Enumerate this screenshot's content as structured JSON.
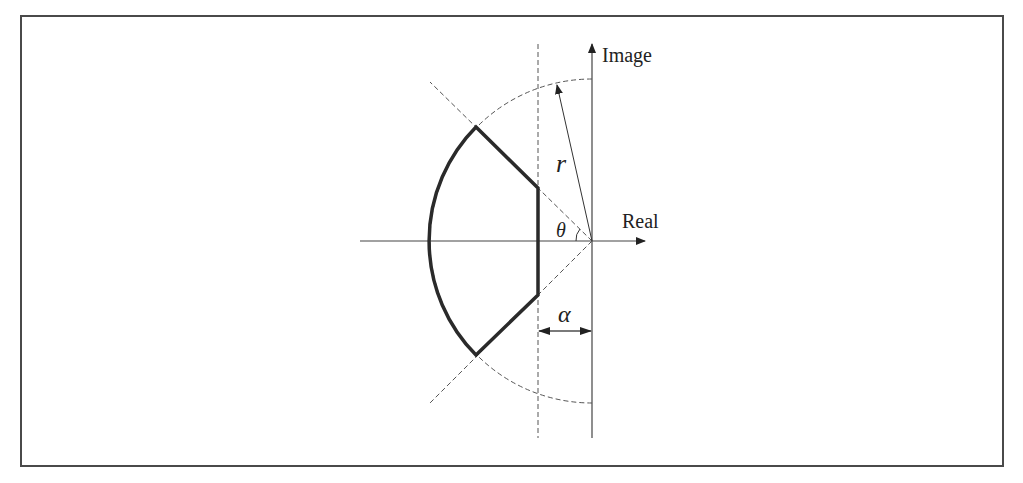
{
  "diagram": {
    "title": "",
    "axes": {
      "horizontal_label": "Real",
      "vertical_label": "Image"
    },
    "symbols": {
      "radius": "r",
      "angle": "θ",
      "offset": "α"
    },
    "colors": {
      "region_boundary": "#2a2a2a",
      "axes": "#444444",
      "guides_dashed": "#555555",
      "frame": "#4a4a4a"
    }
  }
}
